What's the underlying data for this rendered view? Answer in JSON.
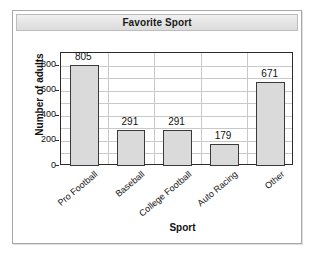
{
  "window": {
    "title": "Favorite Sport"
  },
  "chart_data": {
    "type": "bar",
    "title": "Favorite Sport",
    "xlabel": "Sport",
    "ylabel": "Number of adults",
    "categories": [
      "Pro Football",
      "Baseball",
      "College Football",
      "Auto Racing",
      "Other"
    ],
    "values": [
      805,
      291,
      291,
      179,
      671
    ],
    "value_labels": [
      "805",
      "291",
      "291",
      "179",
      "671"
    ],
    "ylim": [
      0,
      900
    ],
    "ytick_values": [
      0,
      200,
      400,
      600,
      800
    ],
    "ytick_labels": [
      "0",
      "200",
      "400",
      "600",
      "800"
    ],
    "gridline_interval": 100,
    "grid": true,
    "legend": false,
    "bar_fill_color": "#dadada",
    "bar_edge_color": "#3a3a3a",
    "grid_color": "#c9c9c9",
    "axis_color": "#2b2b2b",
    "x_label_rotation_deg": -40
  }
}
